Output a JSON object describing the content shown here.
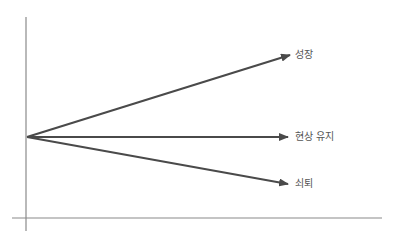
{
  "diagram": {
    "type": "trajectory-arrows",
    "origin": {
      "x": 27,
      "y": 137
    },
    "colors": {
      "arrow": "#4a4a4a",
      "axis": "#8a8a8a",
      "label": "#555555"
    },
    "axes": {
      "vertical": {
        "x": 26,
        "y1": 17,
        "y2": 231
      },
      "horizontal": {
        "y": 218,
        "x1": 12,
        "x2": 382
      }
    },
    "arrows": [
      {
        "id": "growth",
        "label": "성장",
        "tip": {
          "x": 290,
          "y": 55
        },
        "label_pos": {
          "x": 295,
          "y": 49
        }
      },
      {
        "id": "status-quo",
        "label": "현상 유지",
        "tip": {
          "x": 288,
          "y": 137
        },
        "label_pos": {
          "x": 295,
          "y": 131
        }
      },
      {
        "id": "decline",
        "label": "쇠퇴",
        "tip": {
          "x": 288,
          "y": 184
        },
        "label_pos": {
          "x": 295,
          "y": 178
        }
      }
    ]
  }
}
